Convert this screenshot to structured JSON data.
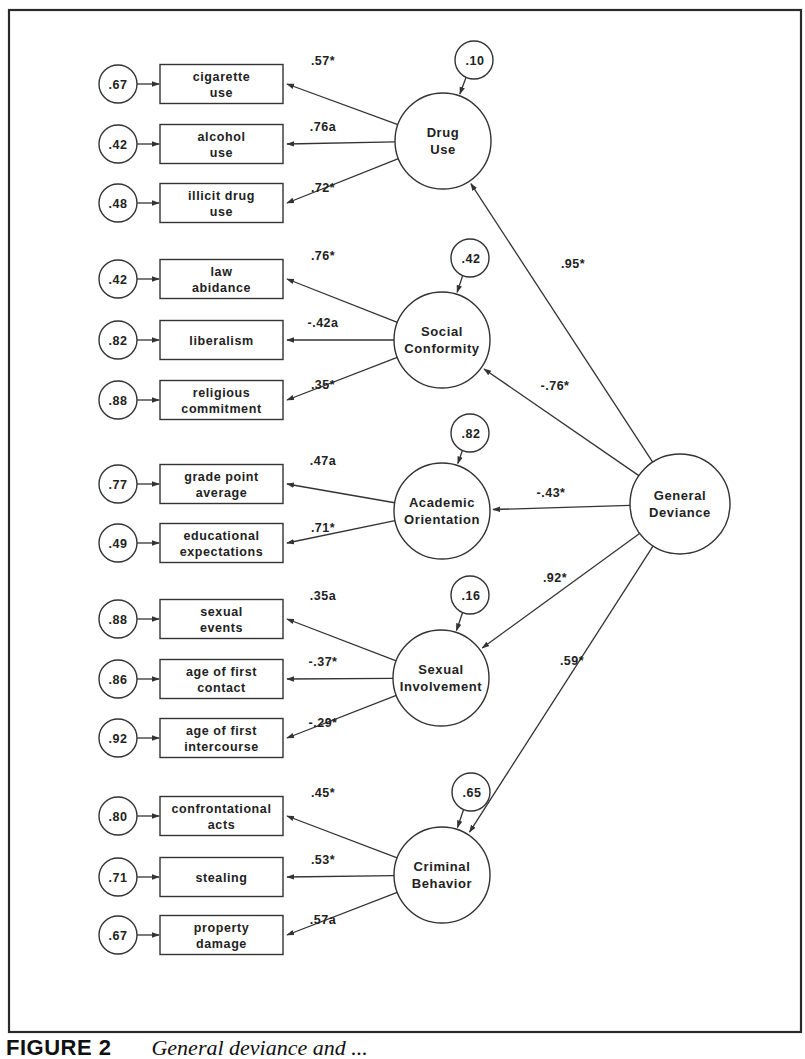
{
  "caption": {
    "figure_label": "FIGURE 2",
    "title": "General deviance and ..."
  },
  "general_factor": {
    "label_line1": "General",
    "label_line2": "Deviance",
    "cx": 680,
    "cy": 504,
    "r": 50
  },
  "factors": [
    {
      "label_line1": "Drug",
      "label_line2": "Use",
      "cx": 443,
      "cy": 141,
      "r": 48,
      "disturbance": ".10",
      "dcx": 474,
      "dcy": 60,
      "path_from_general": ".95*",
      "path_label_x": 573,
      "path_label_y": 268,
      "indicators": [
        {
          "line1": "cigarette",
          "line2": "use",
          "error": ".67",
          "loading": ".57*",
          "y": 84
        },
        {
          "line1": "alcohol",
          "line2": "use",
          "error": ".42",
          "loading": ".76a",
          "y": 144
        },
        {
          "line1": "illicit drug",
          "line2": "use",
          "error": ".48",
          "loading": ".72*",
          "y": 203
        }
      ]
    },
    {
      "label_line1": "Social",
      "label_line2": "Conformity",
      "cx": 442,
      "cy": 340,
      "r": 48,
      "disturbance": ".42",
      "dcx": 470,
      "dcy": 258,
      "path_from_general": "-.76*",
      "path_label_x": 555,
      "path_label_y": 390,
      "indicators": [
        {
          "line1": "law",
          "line2": "abidance",
          "error": ".42",
          "loading": ".76*",
          "y": 279
        },
        {
          "line1": "liberalism",
          "line2": "",
          "error": ".82",
          "loading": "-.42a",
          "y": 340
        },
        {
          "line1": "religious",
          "line2": "commitment",
          "error": ".88",
          "loading": ".35*",
          "y": 400
        }
      ]
    },
    {
      "label_line1": "Academic",
      "label_line2": "Orientation",
      "cx": 442,
      "cy": 511,
      "r": 48,
      "disturbance": ".82",
      "dcx": 470,
      "dcy": 433,
      "path_from_general": "-.43*",
      "path_label_x": 551,
      "path_label_y": 497,
      "indicators": [
        {
          "line1": "grade point",
          "line2": "average",
          "error": ".77",
          "loading": ".47a",
          "y": 484
        },
        {
          "line1": "educational",
          "line2": "expectations",
          "error": ".49",
          "loading": ".71*",
          "y": 543
        }
      ]
    },
    {
      "label_line1": "Sexual",
      "label_line2": "Involvement",
      "cx": 441,
      "cy": 678,
      "r": 48,
      "disturbance": ".16",
      "dcx": 470,
      "dcy": 595,
      "path_from_general": ".92*",
      "path_label_x": 555,
      "path_label_y": 582,
      "indicators": [
        {
          "line1": "sexual",
          "line2": "events",
          "error": ".88",
          "loading": ".35a",
          "y": 619
        },
        {
          "line1": "age of first",
          "line2": "contact",
          "error": ".86",
          "loading": "-.37*",
          "y": 679
        },
        {
          "line1": "age of first",
          "line2": "intercourse",
          "error": ".92",
          "loading": "-.29*",
          "y": 738
        }
      ]
    },
    {
      "label_line1": "Criminal",
      "label_line2": "Behavior",
      "cx": 442,
      "cy": 875,
      "r": 48,
      "disturbance": ".65",
      "dcx": 471,
      "dcy": 792,
      "path_from_general": ".59*",
      "path_label_x": 572,
      "path_label_y": 665,
      "indicators": [
        {
          "line1": "confrontational",
          "line2": "acts",
          "error": ".80",
          "loading": ".45*",
          "y": 816
        },
        {
          "line1": "stealing",
          "line2": "",
          "error": ".71",
          "loading": ".53*",
          "y": 877
        },
        {
          "line1": "property",
          "line2": "damage",
          "error": ".67",
          "loading": ".57a",
          "y": 935
        }
      ]
    }
  ],
  "layout": {
    "frame": {
      "x": 9,
      "y": 10,
      "w": 792,
      "h": 1022
    },
    "error_cx": 118,
    "error_r": 19,
    "box_x": 160,
    "box_w": 123,
    "box_h": 39
  }
}
